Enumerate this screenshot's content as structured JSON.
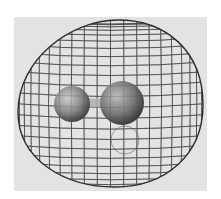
{
  "figure": {
    "background": "#ffffff",
    "panel": {
      "x": 14,
      "y": 17,
      "w": 193,
      "h": 174,
      "color": "#e3e3e3"
    },
    "mesh": {
      "color": "#4a4a4a",
      "outline_color": "#2e2e2e",
      "bbox": {
        "left": 18,
        "top": 20,
        "right": 203,
        "bottom": 187
      },
      "meridian_count": 22,
      "parallel_count": 24
    },
    "molecule": {
      "atoms": [
        {
          "name": "small-atom",
          "cx": 72,
          "cy": 104,
          "r": 18,
          "color": "#8a8a8a"
        },
        {
          "name": "large-atom",
          "cx": 122,
          "cy": 103,
          "r": 22,
          "color": "#7c7c7c"
        }
      ],
      "bond": {
        "x1": 86,
        "y1": 103,
        "x2": 104,
        "y2": 103,
        "width": 9,
        "color": "#b8b8b8"
      }
    },
    "inner_lobe": {
      "cx": 125,
      "cy": 140,
      "r": 14,
      "color": "#5a5a5a"
    }
  }
}
